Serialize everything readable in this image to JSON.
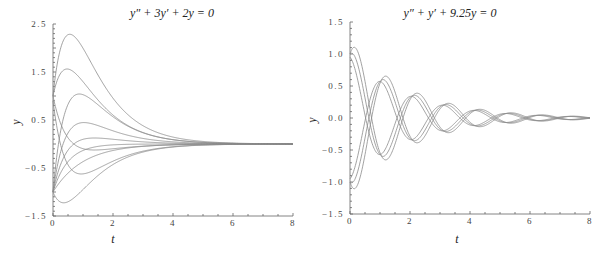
{
  "chart_data": [
    {
      "type": "line",
      "title": "y″ + 3y′ + 2y = 0",
      "xlabel": "t",
      "ylabel": "y",
      "xlim": [
        0,
        8
      ],
      "ylim": [
        -1.5,
        2.5
      ],
      "x_ticks": [
        0,
        2,
        4,
        6,
        8
      ],
      "y_ticks": [
        "2.5",
        "1.5",
        "0.5",
        "-0.5",
        "-1.5"
      ],
      "grid": false,
      "solution_form": "y = c1·e^(-t) + c2·e^(-2t)",
      "series": [
        {
          "name": "y0=1, v0=6",
          "y0": 1,
          "v0": 6,
          "peak": 2.05
        },
        {
          "name": "y0=1, v0=3",
          "y0": 1,
          "v0": 3,
          "peak": 1.35
        },
        {
          "name": "y0=0.9, v0=-5",
          "y0": 0.9,
          "v0": -5,
          "min": -0.55
        },
        {
          "name": "y0=1, v0=-3",
          "y0": 1,
          "v0": -3
        },
        {
          "name": "y0=-1, v0=7",
          "y0": -1,
          "v0": 7,
          "peak": 0.6
        },
        {
          "name": "y0=-1, v0=4.5",
          "y0": -1,
          "v0": 4.5,
          "peak": 0.15
        },
        {
          "name": "y0=-1, v0=3",
          "y0": -1,
          "v0": 3
        },
        {
          "name": "y0=-1, v0=2",
          "y0": -1,
          "v0": 2
        },
        {
          "name": "y0=-1, v0=1",
          "y0": -1,
          "v0": 1
        },
        {
          "name": "y0=-1, v0=-1.5",
          "y0": -1,
          "v0": -1.5,
          "min": -1.2
        }
      ]
    },
    {
      "type": "line",
      "title": "y″ + y′ + 9.25y = 0",
      "xlabel": "t",
      "ylabel": "y",
      "xlim": [
        0,
        8
      ],
      "ylim": [
        -1.5,
        1.5
      ],
      "x_ticks": [
        0,
        2,
        4,
        6,
        8
      ],
      "y_ticks": [
        "1.5",
        "1.0",
        "0.5",
        "0.0",
        "-0.5",
        "-1.0",
        "-1.5"
      ],
      "grid": false,
      "solution_form": "y = e^(-t/2)(a·cos3t + b·sin3t)",
      "series": [
        {
          "name": "y0=1, v0=1.5",
          "y0": 1,
          "v0": 1.5,
          "peak": 1.18
        },
        {
          "name": "y0=1, v0=0.5",
          "y0": 1,
          "v0": 0.5,
          "peak": 1.05
        },
        {
          "name": "y0=0.95, v0=-0.5",
          "y0": 0.95,
          "v0": -0.5
        },
        {
          "name": "y0=-1, v0=-1.5",
          "y0": -1,
          "v0": -1.5,
          "min": -1.18
        },
        {
          "name": "y0=-1, v0=-0.5",
          "y0": -1,
          "v0": -0.5,
          "min": -1.05
        },
        {
          "name": "y0=-0.95, v0=0.5",
          "y0": -0.95,
          "v0": 0.5
        }
      ]
    }
  ]
}
